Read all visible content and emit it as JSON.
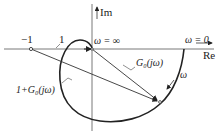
{
  "diagram": {
    "type": "nyquist-plot",
    "axes": {
      "real_label": "Re",
      "imag_label": "Im"
    },
    "points": {
      "minus_one": "−1",
      "omega_inf": "ω = ∞",
      "omega_zero": "ω = 0"
    },
    "labels": {
      "unit": "1",
      "g0": "G₀(jω)",
      "one_plus_g0": "1+G₀(jω)",
      "omega": "ω"
    },
    "colors": {
      "stroke": "#222222",
      "axis": "#555555"
    }
  }
}
